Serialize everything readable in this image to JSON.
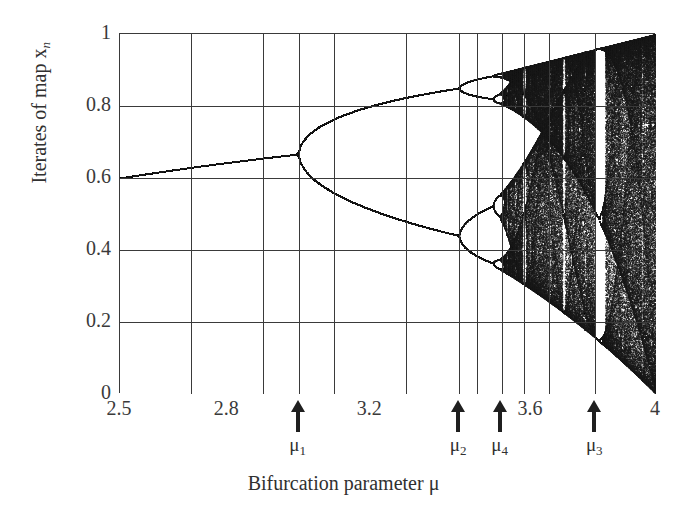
{
  "figure": {
    "kind": "bifurcation-diagram",
    "background_color": "#ffffff",
    "ink_color": "#1a1a1a",
    "grid_color": "#3a3a3a",
    "axis_title_x": "Bifurcation parameter μ",
    "axis_title_y_prefix": "Iterates of map ",
    "axis_title_y_var": "x",
    "axis_title_y_sub": "n"
  },
  "chart_data": {
    "type": "scatter",
    "title": "",
    "subtitle": "",
    "xlabel": "Bifurcation parameter μ",
    "ylabel": "Iterates of map x_n",
    "xlim": [
      2.5,
      4.0
    ],
    "ylim": [
      0,
      1
    ],
    "grid": true,
    "legend": "none",
    "map_equation": "x_{n+1} = μ x_n (1 - x_n)",
    "x_ticks": [
      2.5,
      2.8,
      3.2,
      3.6,
      4
    ],
    "x_tick_labels": [
      "2.5",
      "2.8",
      "3.2",
      "3.6",
      "4"
    ],
    "x_gridlines": [
      2.5,
      2.7,
      2.9,
      3.0,
      3.1,
      3.3,
      3.45,
      3.5,
      3.57,
      3.63,
      3.7,
      3.83,
      4.0
    ],
    "y_ticks": [
      0,
      0.2,
      0.4,
      0.6,
      0.8,
      1
    ],
    "y_tick_labels": [
      "0",
      "0.2",
      "0.4",
      "0.6",
      "0.8",
      "1"
    ],
    "y_gridlines": [
      0,
      0.2,
      0.4,
      0.6,
      0.8,
      1
    ],
    "annotations": [
      {
        "name": "mu1",
        "label": "μ",
        "sub": "1",
        "x": 3.0,
        "meaning": "first period-doubling (period 1 → 2)"
      },
      {
        "name": "mu2",
        "label": "μ",
        "sub": "2",
        "x": 3.449,
        "meaning": "second period-doubling (period 2 → 4)"
      },
      {
        "name": "mu4",
        "label": "μ",
        "sub": "4",
        "x": 3.57,
        "meaning": "accumulation point / onset of chaos"
      },
      {
        "name": "mu3",
        "label": "μ",
        "sub": "3",
        "x": 3.83,
        "meaning": "period-3 window"
      }
    ],
    "series": [
      {
        "name": "logistic map attractor",
        "color": "#1a1a1a",
        "x_start": 2.5,
        "x_end": 4.0,
        "x_samples": 1340,
        "transient_iterations": 320,
        "plotted_iterations": 420,
        "x0": 0.35,
        "description": "Attracting set of x_{n+1}=μ x_n (1-x_n): single fixed point rising from 0.60 at μ=2.5 to 0.667 at μ=3, period-doubling cascade, then chaotic band with periodic windows."
      }
    ],
    "reference_points": [
      {
        "mu": 2.5,
        "x": 0.6
      },
      {
        "mu": 2.8,
        "x": 0.643
      },
      {
        "mu": 3.0,
        "x": 0.667
      },
      {
        "mu": 3.2,
        "x_upper": 0.799,
        "x_lower": 0.513
      },
      {
        "mu": 3.4,
        "x_upper": 0.842,
        "x_lower": 0.452
      },
      {
        "mu": 3.449,
        "x_upper": 0.849,
        "x_lower": 0.44
      },
      {
        "mu": 3.57,
        "x_upper": 0.9,
        "x_lower": 0.33
      },
      {
        "mu": 4.0,
        "x_upper": 1.0,
        "x_lower": 0.0
      }
    ]
  },
  "axes": {
    "y_tick_labels": [
      {
        "value": 1,
        "text": "1"
      },
      {
        "value": 0.8,
        "text": "0.8"
      },
      {
        "value": 0.6,
        "text": "0.6"
      },
      {
        "value": 0.4,
        "text": "0.4"
      },
      {
        "value": 0.2,
        "text": "0.2"
      },
      {
        "value": 0,
        "text": "0"
      }
    ],
    "x_tick_labels": [
      {
        "value": 2.5,
        "text": "2.5"
      },
      {
        "value": 2.8,
        "text": "2.8"
      },
      {
        "value": 3.2,
        "text": "3.2"
      },
      {
        "value": 3.6,
        "text": "3.6"
      },
      {
        "value": 4.0,
        "text": "4"
      }
    ]
  },
  "markers": [
    {
      "label": "μ",
      "sub": "1",
      "value": 3.0
    },
    {
      "label": "μ",
      "sub": "2",
      "value": 3.449
    },
    {
      "label": "μ",
      "sub": "4",
      "value": 3.565
    },
    {
      "label": "μ",
      "sub": "3",
      "value": 3.83
    }
  ]
}
